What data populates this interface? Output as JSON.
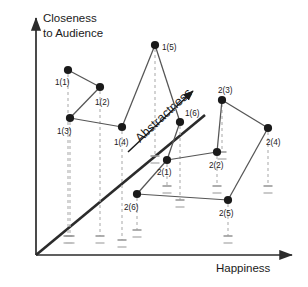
{
  "figure": {
    "title": "",
    "background_color": "#ffffff",
    "axis_color": "#2b2b2b",
    "point_color": "#1a1a1a",
    "link_color": "#555555",
    "projection_color": "#b0b0b0"
  },
  "axes": {
    "y_label_line1": "Closeness",
    "y_label_line2": "to Audience",
    "x_label": "Happiness",
    "z_label": "Abstractness"
  },
  "chart_data": {
    "type": "scatter",
    "title": "",
    "xlabel": "Happiness",
    "ylabel": "Closeness to Audience",
    "zlabel": "Abstractness",
    "grid": false,
    "legend": "none",
    "axis_style": "three-axis pseudo-3D, arrows, no tick values",
    "xlim": [
      0,
      1
    ],
    "ylim": [
      0,
      1
    ],
    "note": "Positions given in pixel coordinates of the 308x287 canvas; dashed gray drop-lines project each point onto the oblique Abstractness axis.",
    "series": [
      {
        "name": "1",
        "points": [
          {
            "label": "1(1)",
            "px": 68,
            "py": 70,
            "label_dx": -13,
            "label_dy": 15,
            "drop_to": 236
          },
          {
            "label": "1(2)",
            "px": 100,
            "py": 87,
            "label_dx": -5,
            "label_dy": 18,
            "drop_to": 236
          },
          {
            "label": "1(3)",
            "px": 70,
            "py": 118,
            "label_dx": -13,
            "label_dy": 16,
            "drop_to": 236
          },
          {
            "label": "1(4)",
            "px": 122,
            "py": 127,
            "label_dx": -8,
            "label_dy": 18,
            "drop_to": 240
          },
          {
            "label": "1(5)",
            "px": 155,
            "py": 45,
            "label_dx": 7,
            "label_dy": 5,
            "drop_to": 156
          },
          {
            "label": "1(6)",
            "px": 180,
            "py": 122,
            "label_dx": 5,
            "label_dy": -6,
            "drop_to": 200
          }
        ],
        "connections": [
          [
            0,
            1
          ],
          [
            1,
            2
          ],
          [
            2,
            3
          ],
          [
            3,
            4
          ],
          [
            4,
            5
          ]
        ]
      },
      {
        "name": "2",
        "points": [
          {
            "label": "2(1)",
            "px": 167,
            "py": 160,
            "label_dx": -10,
            "label_dy": 15,
            "drop_to": 186
          },
          {
            "label": "2(2)",
            "px": 217,
            "py": 152,
            "label_dx": -8,
            "label_dy": 16,
            "drop_to": 186
          },
          {
            "label": "2(3)",
            "px": 222,
            "py": 100,
            "label_dx": -4,
            "label_dy": -7,
            "drop_to": 152
          },
          {
            "label": "2(4)",
            "px": 268,
            "py": 128,
            "label_dx": -2,
            "label_dy": 17,
            "drop_to": 186
          },
          {
            "label": "2(5)",
            "px": 228,
            "py": 200,
            "label_dx": -9,
            "label_dy": 16,
            "drop_to": 236
          },
          {
            "label": "2(6)",
            "px": 137,
            "py": 194,
            "label_dx": -13,
            "label_dy": 16,
            "drop_to": 230
          }
        ],
        "connections": [
          [
            0,
            1
          ],
          [
            1,
            2
          ],
          [
            2,
            3
          ],
          [
            3,
            4
          ],
          [
            4,
            5
          ],
          [
            5,
            0
          ]
        ]
      }
    ],
    "cross_series_links": [
      {
        "from": "1(6)",
        "to": "2(1)"
      }
    ]
  },
  "geometry": {
    "origin_x": 36,
    "origin_y": 255,
    "y_axis_top": 14,
    "x_axis_right": 298,
    "diagonal_end_x": 205,
    "diagonal_end_y": 115,
    "abstractness_arrow": {
      "x1": 128,
      "y1": 152,
      "x2": 196,
      "y2": 88
    },
    "abstractness_text_angle": -43
  }
}
